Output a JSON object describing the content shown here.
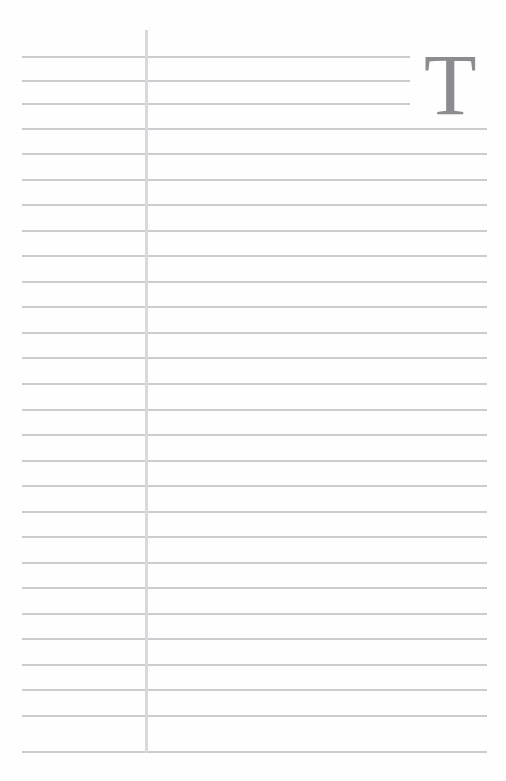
{
  "page": {
    "name": "lined-notebook-page",
    "width": 506,
    "height": 781,
    "background_color": "#ffffff"
  },
  "drop_cap": {
    "letter": "T",
    "color": "#8b8b90",
    "font_size_px": 86,
    "left_px": 424,
    "top_px": 42
  },
  "margin_rule": {
    "color": "#d8d8dd",
    "x_px": 145,
    "top_px": 30,
    "bottom_px": 753,
    "width_px": 3
  },
  "ruling": {
    "color": "#c9c9ce",
    "thickness_px": 2,
    "left_px": 22,
    "right_full_px": 487,
    "right_short_px": 410,
    "spacing_px": 25.7,
    "first_line_y_px": 56,
    "short_line_count": 3,
    "total_line_count": 28,
    "lines": [
      {
        "index": 1,
        "y": 56,
        "left": 22,
        "right": 410,
        "short": true
      },
      {
        "index": 2,
        "y": 80,
        "left": 22,
        "right": 410,
        "short": true
      },
      {
        "index": 3,
        "y": 103,
        "left": 22,
        "right": 410,
        "short": true
      },
      {
        "index": 4,
        "y": 128,
        "left": 22,
        "right": 487,
        "short": false
      },
      {
        "index": 5,
        "y": 153,
        "left": 22,
        "right": 487,
        "short": false
      },
      {
        "index": 6,
        "y": 179,
        "left": 22,
        "right": 487,
        "short": false
      },
      {
        "index": 7,
        "y": 204,
        "left": 22,
        "right": 487,
        "short": false
      },
      {
        "index": 8,
        "y": 230,
        "left": 22,
        "right": 487,
        "short": false
      },
      {
        "index": 9,
        "y": 255,
        "left": 22,
        "right": 487,
        "short": false
      },
      {
        "index": 10,
        "y": 281,
        "left": 22,
        "right": 487,
        "short": false
      },
      {
        "index": 11,
        "y": 306,
        "left": 22,
        "right": 487,
        "short": false
      },
      {
        "index": 12,
        "y": 332,
        "left": 22,
        "right": 487,
        "short": false
      },
      {
        "index": 13,
        "y": 357,
        "left": 22,
        "right": 487,
        "short": false
      },
      {
        "index": 14,
        "y": 383,
        "left": 22,
        "right": 487,
        "short": false
      },
      {
        "index": 15,
        "y": 409,
        "left": 22,
        "right": 487,
        "short": false
      },
      {
        "index": 16,
        "y": 434,
        "left": 22,
        "right": 487,
        "short": false
      },
      {
        "index": 17,
        "y": 460,
        "left": 22,
        "right": 487,
        "short": false
      },
      {
        "index": 18,
        "y": 485,
        "left": 22,
        "right": 487,
        "short": false
      },
      {
        "index": 19,
        "y": 511,
        "left": 22,
        "right": 487,
        "short": false
      },
      {
        "index": 20,
        "y": 536,
        "left": 22,
        "right": 487,
        "short": false
      },
      {
        "index": 21,
        "y": 562,
        "left": 22,
        "right": 487,
        "short": false
      },
      {
        "index": 22,
        "y": 587,
        "left": 22,
        "right": 487,
        "short": false
      },
      {
        "index": 23,
        "y": 613,
        "left": 22,
        "right": 487,
        "short": false
      },
      {
        "index": 24,
        "y": 638,
        "left": 22,
        "right": 487,
        "short": false
      },
      {
        "index": 25,
        "y": 664,
        "left": 22,
        "right": 487,
        "short": false
      },
      {
        "index": 26,
        "y": 689,
        "left": 22,
        "right": 487,
        "short": false
      },
      {
        "index": 27,
        "y": 715,
        "left": 22,
        "right": 487,
        "short": false
      },
      {
        "index": 28,
        "y": 751,
        "left": 22,
        "right": 487,
        "short": false
      }
    ]
  }
}
